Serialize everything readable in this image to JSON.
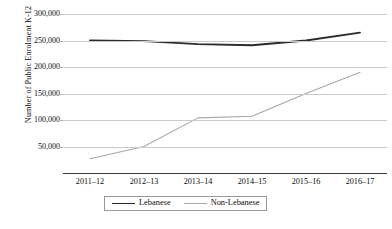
{
  "chart_data": {
    "type": "line",
    "title": "",
    "xlabel": "",
    "ylabel": "Number of Public Enrolment K-12",
    "categories": [
      "2011–12",
      "2012–13",
      "2013–14",
      "2014–15",
      "2015–16",
      "2016–17"
    ],
    "series": [
      {
        "name": "Lebanese",
        "values": [
          250000,
          249000,
          243000,
          241000,
          250000,
          265000
        ],
        "color": "#2b2b2b",
        "line_width": 1.8
      },
      {
        "name": "Non-Lebanese",
        "values": [
          27000,
          50000,
          104000,
          107000,
          150000,
          190000
        ],
        "color": "#a8a8a8",
        "line_width": 1.1
      }
    ],
    "ylim": [
      0,
      300000
    ],
    "ytick_values": [
      300000,
      250000,
      200000,
      150000,
      100000,
      50000
    ],
    "ytick_labels": [
      "300,000",
      "250,000",
      "200,000",
      "150,000",
      "100,000",
      "50,000"
    ],
    "grid": true,
    "legend_position": "bottom",
    "legend_entries": [
      "Lebanese",
      "Non-Lebanese"
    ],
    "gridline_color": "#c9c9c9",
    "axis_color": "#3a3a3a",
    "background_color": "#ffffff"
  }
}
